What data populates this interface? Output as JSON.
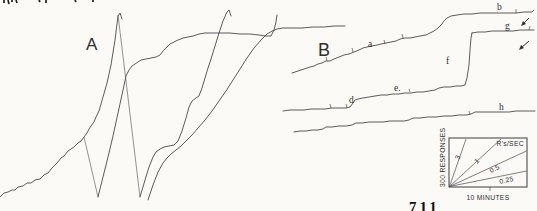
{
  "figure": {
    "panel_labels": {
      "a": "A",
      "b": "B"
    },
    "record_marks": {
      "a": "a",
      "b": "b",
      "d": "d",
      "e": "e.",
      "f": "f",
      "g": "g",
      "h": "h"
    },
    "legend": {
      "title": "R's/SEC",
      "rates": [
        "3",
        "1",
        "0.5",
        "0.25"
      ],
      "y_axis_label": "300 RESPONSES",
      "x_axis_label": "10 MINUTES"
    },
    "page_number": "711",
    "colors": {
      "ink": "#4a4a4a",
      "paper": "#fbfaf7"
    }
  }
}
